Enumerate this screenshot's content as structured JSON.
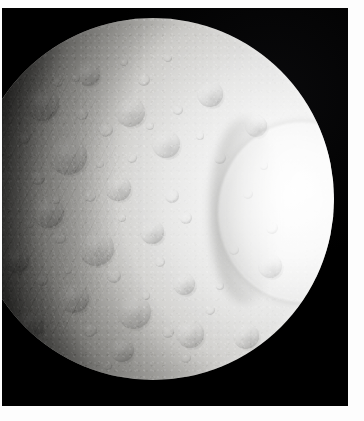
{
  "image": {
    "subject": "Tethys",
    "subject_type": "icy moon",
    "scene": "sunlit crescent-to-gibbous disk of a heavily cratered icy moon against black space",
    "alt_text": "Grayscale spacecraft photograph of Saturn's moon Tethys; a brightly lit, heavily cratered sphere fills most of the frame with a large bright circular impact basin on the right side and a dark shadowed terminator along the left edge.",
    "palette": {
      "space_black": "#000000",
      "page_white": "#ffffff",
      "limb_highlight": "#fcfcfc",
      "basin_bright": "#f6f6f5",
      "terrain_midtone": "#c9c8c5",
      "terrain_shadow": "#7e7d79",
      "terminator_dark": "#1a1a19"
    },
    "frame": {
      "margin_top_px": 8,
      "margin_left_px": 2,
      "margin_right_px": 14,
      "margin_bottom_px": 15,
      "photo_width_px": 346,
      "photo_height_px": 398
    },
    "features": [
      {
        "name": "illuminated-disk",
        "label": "Illuminated moon disk",
        "center_x": 155,
        "center_y": 205,
        "radius_px": 180
      },
      {
        "name": "odysseus-basin",
        "label": "Large bright impact basin",
        "center_x": 270,
        "center_y": 192,
        "radius_px": 80
      },
      {
        "name": "terminator",
        "label": "Day-night terminator shadow",
        "side": "left"
      },
      {
        "name": "cratered-terrain",
        "label": "Heavily cratered ancient terrain",
        "side": "left-center"
      },
      {
        "name": "bright-limb",
        "label": "Sunlit limb highlight",
        "side": "right"
      }
    ]
  }
}
